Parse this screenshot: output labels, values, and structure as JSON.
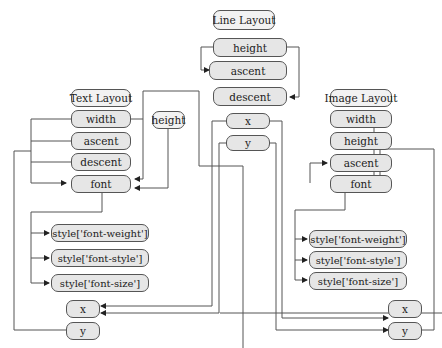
{
  "diagram": {
    "line_layout": {
      "title": "Line Layout",
      "fields": [
        "height",
        "ascent",
        "descent"
      ]
    },
    "text_layout": {
      "title": "Text Layout",
      "fields": [
        "width",
        "ascent",
        "descent",
        "font"
      ],
      "extra": "height"
    },
    "image_layout": {
      "title": "Image Layout",
      "fields": [
        "width",
        "height",
        "ascent",
        "font"
      ]
    },
    "center_xy": [
      "x",
      "y"
    ],
    "left_styles": [
      "style['font-weight']",
      "style['font-style']",
      "style['font-size']"
    ],
    "right_styles": [
      "style['font-weight']",
      "style['font-style']",
      "style['font-size']"
    ],
    "left_xy": [
      "x",
      "y"
    ],
    "right_xy": [
      "x",
      "y"
    ]
  },
  "colors": {
    "node_fill": "#e6e6e6",
    "title_fill": "#f2f2f2",
    "stroke": "#555555"
  }
}
